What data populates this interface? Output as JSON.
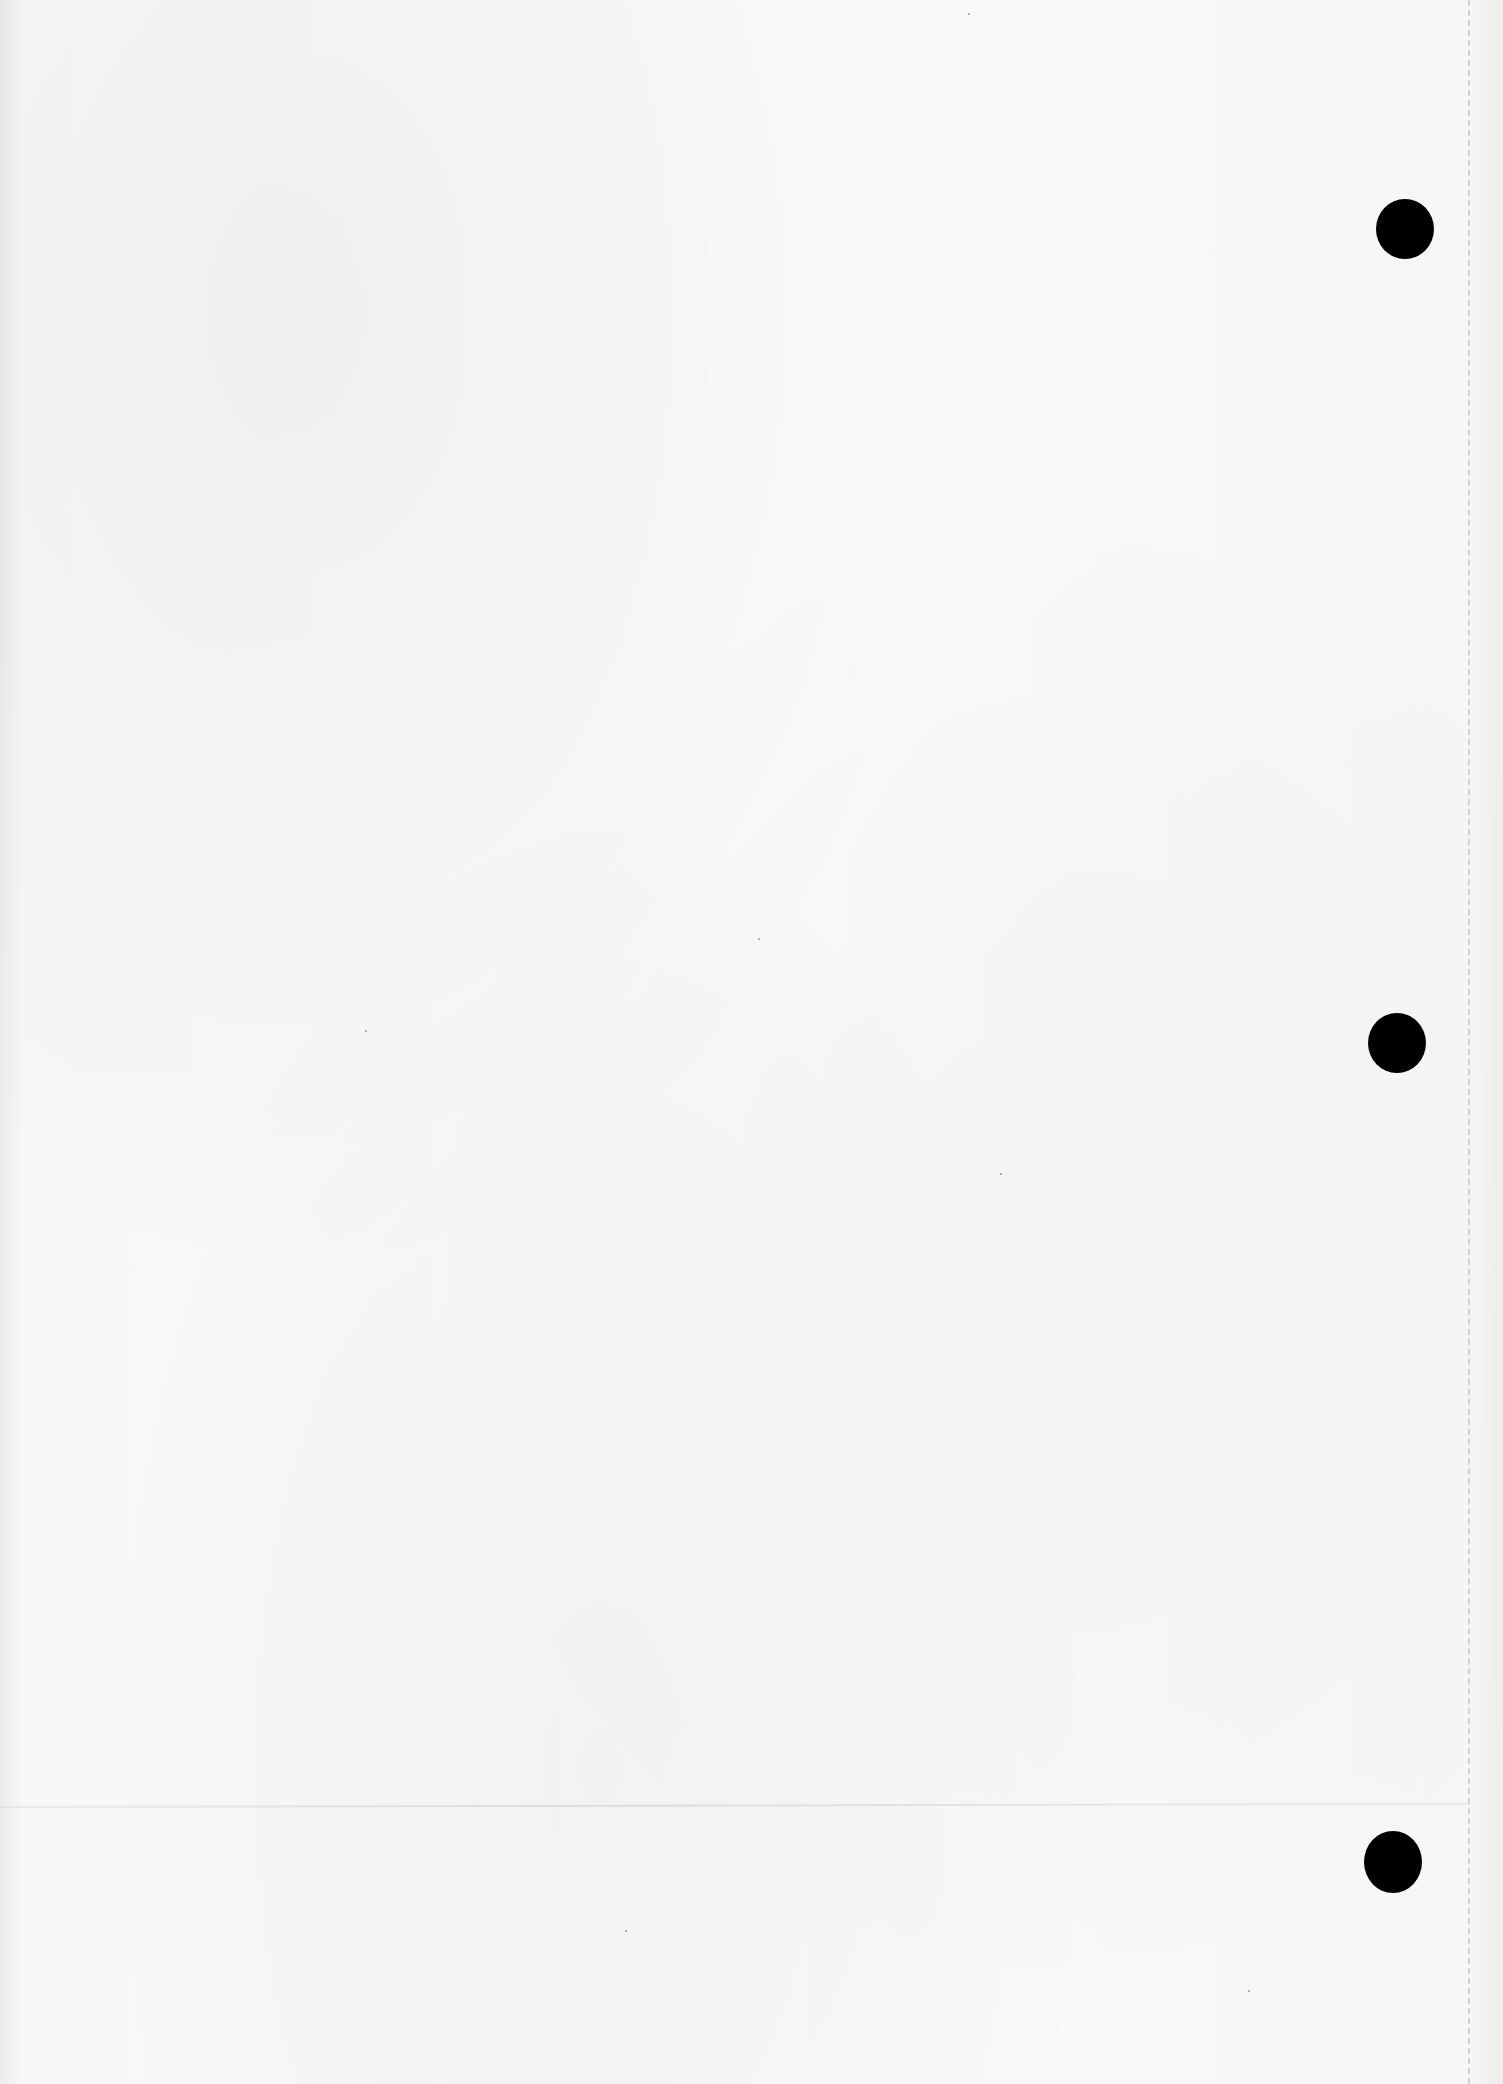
{
  "document": {
    "type": "blank-sheet",
    "text_content": [],
    "paper_color": "#f7f7f6"
  },
  "punch_holes": [
    {
      "cx": 1405,
      "cy": 229,
      "rx": 29,
      "ry": 30,
      "color": "#000000"
    },
    {
      "cx": 1397,
      "cy": 1043,
      "rx": 29,
      "ry": 30,
      "color": "#000000"
    },
    {
      "cx": 1393,
      "cy": 1862,
      "rx": 29,
      "ry": 31,
      "color": "#000000"
    }
  ],
  "perforation": {
    "x": 1468,
    "style": "dashed",
    "color": "#c9c9c8"
  },
  "fold_line": {
    "y": 1806,
    "color": "#d8d8d7"
  },
  "specks": [
    {
      "x": 365,
      "y": 1030
    },
    {
      "x": 758,
      "y": 938
    },
    {
      "x": 1000,
      "y": 1173
    },
    {
      "x": 625,
      "y": 1930
    },
    {
      "x": 1248,
      "y": 1990
    },
    {
      "x": 968,
      "y": 13
    }
  ]
}
